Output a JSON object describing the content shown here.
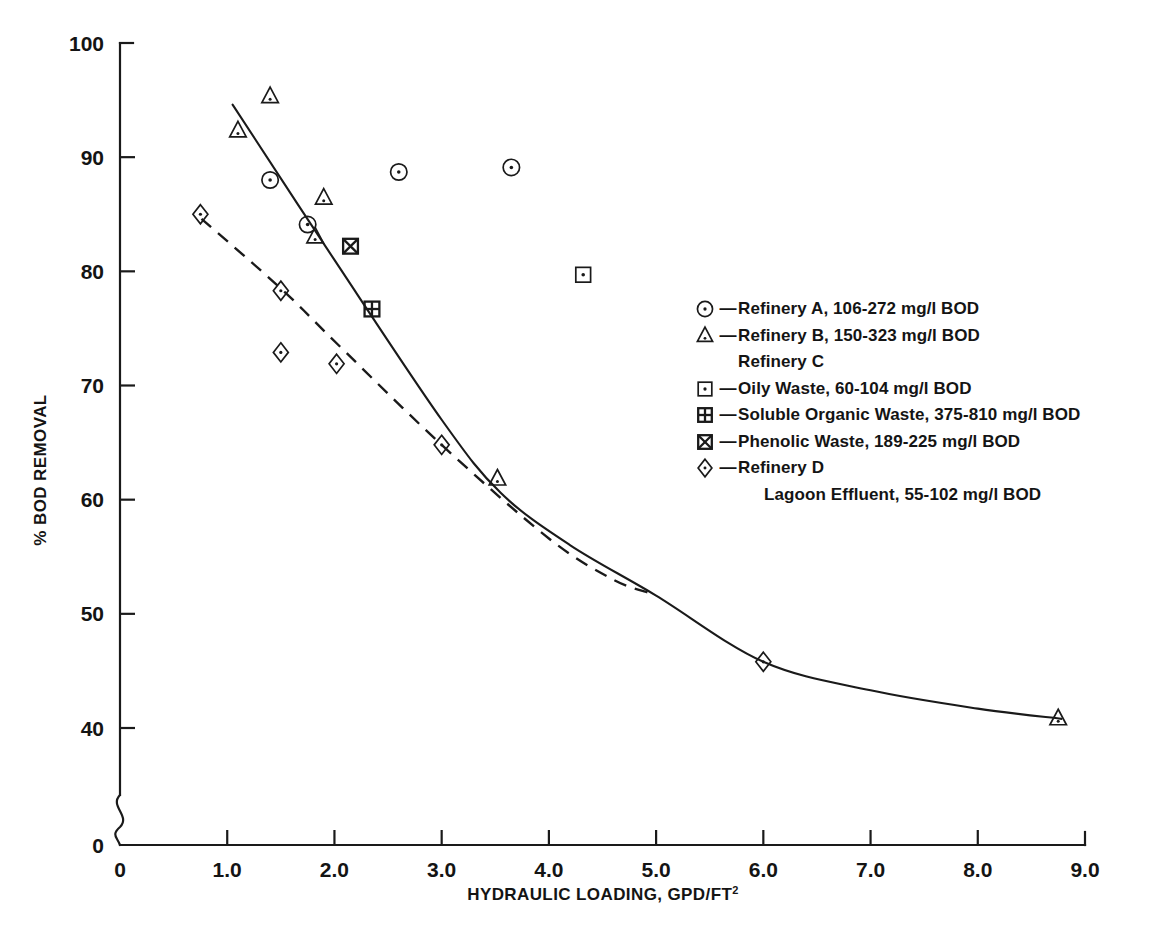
{
  "chart_data": {
    "type": "scatter",
    "title": "",
    "xlabel": "HYDRAULIC LOADING, GPD/FT2",
    "xlabel_base": "HYDRAULIC LOADING, GPD/FT",
    "xlabel_exponent": "2",
    "ylabel": "% BOD REMOVAL",
    "xlim": [
      0,
      9.0
    ],
    "ylim": [
      0,
      100
    ],
    "y_axis_break": true,
    "y_axis_break_note": "axis broken between 0 and 40",
    "grid": false,
    "legend_position": "right",
    "xticks": [
      "0",
      "1.0",
      "2.0",
      "3.0",
      "4.0",
      "5.0",
      "6.0",
      "7.0",
      "8.0",
      "9.0"
    ],
    "xtick_values": [
      0,
      1,
      2,
      3,
      4,
      5,
      6,
      7,
      8,
      9
    ],
    "yticks": [
      "0",
      "40",
      "50",
      "60",
      "70",
      "80",
      "90",
      "100"
    ],
    "ytick_values": [
      0,
      40,
      50,
      60,
      70,
      80,
      90,
      100
    ],
    "series": [
      {
        "name": "Refinery A, 106-272 mg/l BOD",
        "short_name": "Refinery A",
        "marker": "circle-dot",
        "points": [
          {
            "x": 1.4,
            "y": 88.0
          },
          {
            "x": 1.75,
            "y": 84.1
          },
          {
            "x": 2.6,
            "y": 88.7
          },
          {
            "x": 3.65,
            "y": 89.1
          }
        ]
      },
      {
        "name": "Refinery B, 150-323 mg/l BOD",
        "short_name": "Refinery B",
        "marker": "triangle",
        "points": [
          {
            "x": 1.1,
            "y": 92.3
          },
          {
            "x": 1.4,
            "y": 95.3
          },
          {
            "x": 1.9,
            "y": 86.4
          },
          {
            "x": 1.82,
            "y": 83.0
          },
          {
            "x": 3.52,
            "y": 61.8
          },
          {
            "x": 8.75,
            "y": 40.8
          }
        ]
      },
      {
        "name": "Refinery C - Oily Waste, 60-104 mg/l BOD",
        "short_name": "Oily Waste",
        "marker": "square-dot",
        "points": [
          {
            "x": 4.32,
            "y": 79.7
          }
        ]
      },
      {
        "name": "Refinery C - Soluble Organic Waste, 375-810 mg/l BOD",
        "short_name": "Soluble Organic Waste",
        "marker": "square-plus",
        "points": [
          {
            "x": 2.35,
            "y": 76.7
          }
        ]
      },
      {
        "name": "Refinery C - Phenolic Waste, 189-225 mg/l BOD",
        "short_name": "Phenolic Waste",
        "marker": "square-x",
        "points": [
          {
            "x": 2.15,
            "y": 82.2
          }
        ]
      },
      {
        "name": "Refinery D - Lagoon Effluent, 55-102 mg/l BOD",
        "short_name": "Refinery D",
        "marker": "diamond",
        "points": [
          {
            "x": 0.75,
            "y": 85.0
          },
          {
            "x": 1.5,
            "y": 78.3
          },
          {
            "x": 1.5,
            "y": 72.9
          },
          {
            "x": 2.02,
            "y": 71.9
          },
          {
            "x": 3.0,
            "y": 64.8
          },
          {
            "x": 6.0,
            "y": 45.8
          }
        ]
      }
    ],
    "trend_lines": [
      {
        "name": "primary-trend",
        "style": "solid",
        "description": "Straight decline then curving tail",
        "points": [
          {
            "x": 1.05,
            "y": 94.6
          },
          {
            "x": 2.0,
            "y": 81.0
          },
          {
            "x": 3.0,
            "y": 67.0
          },
          {
            "x": 3.55,
            "y": 60.6
          },
          {
            "x": 4.2,
            "y": 56.0
          },
          {
            "x": 5.0,
            "y": 51.6
          },
          {
            "x": 6.0,
            "y": 45.8
          },
          {
            "x": 7.0,
            "y": 43.3
          },
          {
            "x": 8.0,
            "y": 41.7
          },
          {
            "x": 8.78,
            "y": 40.8
          }
        ]
      },
      {
        "name": "lagoon-trend",
        "style": "dashed",
        "description": "Refinery D lagoon effluent trend, merges with primary near x=4.6",
        "points": [
          {
            "x": 0.76,
            "y": 84.6
          },
          {
            "x": 1.5,
            "y": 78.5
          },
          {
            "x": 2.02,
            "y": 73.7
          },
          {
            "x": 3.0,
            "y": 64.8
          },
          {
            "x": 4.0,
            "y": 56.6
          },
          {
            "x": 4.6,
            "y": 53.0
          },
          {
            "x": 4.95,
            "y": 51.8
          }
        ]
      }
    ]
  },
  "legend": {
    "rows": [
      {
        "marker": "circle-dot",
        "dash": "—",
        "text": "Refinery A, 106-272 mg/l BOD",
        "indent": false,
        "continuation": false
      },
      {
        "marker": "triangle",
        "dash": "—",
        "text": "Refinery B, 150-323 mg/l BOD",
        "indent": false,
        "continuation": false
      },
      {
        "marker": "none",
        "dash": "",
        "text": "Refinery C",
        "indent": false,
        "continuation": true
      },
      {
        "marker": "square-dot",
        "dash": "—",
        "text": "Oily Waste, 60-104 mg/l BOD",
        "indent": false,
        "continuation": false
      },
      {
        "marker": "square-plus",
        "dash": "—",
        "text": "Soluble Organic Waste, 375-810 mg/l BOD",
        "indent": false,
        "continuation": false
      },
      {
        "marker": "square-x",
        "dash": "—",
        "text": "Phenolic Waste, 189-225 mg/l BOD",
        "indent": false,
        "continuation": false
      },
      {
        "marker": "diamond",
        "dash": "—",
        "text": "Refinery D",
        "indent": false,
        "continuation": false
      },
      {
        "marker": "none",
        "dash": "",
        "text": "Lagoon Effluent, 55-102 mg/l BOD",
        "indent": true,
        "continuation": true
      }
    ]
  },
  "colors": {
    "ink": "#1a1a1a",
    "background": "#ffffff"
  }
}
